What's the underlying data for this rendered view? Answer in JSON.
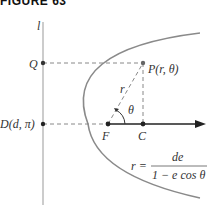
{
  "figure": {
    "title": "FIGURE 63",
    "labels": {
      "directrix": "l",
      "q": "Q",
      "p": "P(r, θ)",
      "r": "r",
      "theta": "θ",
      "d": "D(d, π)",
      "f": "F",
      "c": "C",
      "eq_lhs": "r =",
      "eq_num": "de",
      "eq_den": "1 − e cos θ"
    },
    "colors": {
      "curve": "#8a8a8a",
      "axis": "#222222",
      "dashed": "#888888",
      "directrix": "#aaaaaa"
    }
  }
}
